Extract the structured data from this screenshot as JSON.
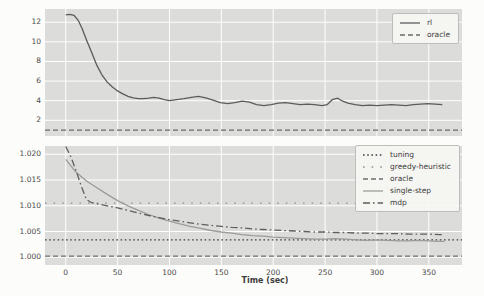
{
  "figure": {
    "xlabel": "Time (sec)",
    "background": "#fcfcfa",
    "plot_background": "#dcdcda",
    "grid_color": "#ffffff",
    "text_color": "#4a4a4a",
    "legend_border": "#bdbdbb"
  },
  "chart_data": [
    {
      "type": "line",
      "title": "",
      "xlabel": "",
      "ylabel": "",
      "xlim": [
        -20,
        382
      ],
      "ylim": [
        0.4,
        13.35
      ],
      "xticks": [
        0,
        50,
        100,
        150,
        200,
        250,
        300,
        350
      ],
      "show_xtick_labels": false,
      "yticks": [
        2,
        4,
        6,
        8,
        10,
        12
      ],
      "ytick_labels": [
        "2",
        "4",
        "6",
        "8",
        "10",
        "12"
      ],
      "grid": true,
      "legend_position": "upper right",
      "series": [
        {
          "name": "rl",
          "style": "solid",
          "color": "#5b5b5b",
          "x": [
            0,
            4,
            8,
            12,
            16,
            20,
            25,
            30,
            35,
            40,
            45,
            50,
            55,
            60,
            65,
            70,
            75,
            80,
            85,
            90,
            95,
            100,
            107,
            114,
            121,
            128,
            135,
            142,
            149,
            156,
            163,
            170,
            177,
            184,
            191,
            198,
            205,
            212,
            219,
            226,
            233,
            240,
            247,
            252,
            257,
            262,
            267,
            272,
            279,
            286,
            293,
            300,
            307,
            314,
            321,
            328,
            335,
            342,
            349,
            356,
            363
          ],
          "y": [
            12.75,
            12.8,
            12.7,
            12.2,
            11.3,
            10.2,
            8.9,
            7.6,
            6.6,
            5.9,
            5.4,
            5.0,
            4.7,
            4.45,
            4.3,
            4.2,
            4.2,
            4.25,
            4.35,
            4.25,
            4.1,
            4.0,
            4.1,
            4.2,
            4.35,
            4.45,
            4.3,
            4.05,
            3.8,
            3.7,
            3.8,
            3.95,
            3.85,
            3.6,
            3.5,
            3.6,
            3.75,
            3.8,
            3.7,
            3.6,
            3.65,
            3.6,
            3.5,
            3.6,
            4.1,
            4.25,
            3.95,
            3.75,
            3.6,
            3.5,
            3.55,
            3.5,
            3.55,
            3.6,
            3.55,
            3.5,
            3.6,
            3.65,
            3.7,
            3.65,
            3.6
          ]
        },
        {
          "name": "oracle",
          "style": "dashed",
          "color": "#696969",
          "x": [
            -20,
            382
          ],
          "y": [
            1.0,
            1.0
          ]
        }
      ]
    },
    {
      "type": "line",
      "title": "",
      "xlabel": "Time (sec)",
      "ylabel": "",
      "xlim": [
        -20,
        382
      ],
      "ylim": [
        0.9985,
        1.0216
      ],
      "xticks": [
        0,
        50,
        100,
        150,
        200,
        250,
        300,
        350
      ],
      "show_xtick_labels": true,
      "xtick_labels": [
        "0",
        "50",
        "100",
        "150",
        "200",
        "250",
        "300",
        "350"
      ],
      "yticks": [
        1.0,
        1.005,
        1.01,
        1.015,
        1.02
      ],
      "ytick_labels": [
        "1.000",
        "1.005",
        "1.010",
        "1.015",
        "1.020"
      ],
      "grid": true,
      "legend_position": "upper right",
      "series": [
        {
          "name": "tuning",
          "style": "dotted",
          "color": "#3f3f3f",
          "x": [
            -20,
            382
          ],
          "y": [
            1.0034,
            1.0034
          ]
        },
        {
          "name": "greedy-heuristic",
          "style": "sparse-dotted",
          "color": "#8f8f8f",
          "x": [
            -20,
            382
          ],
          "y": [
            1.0105,
            1.0105
          ]
        },
        {
          "name": "oracle",
          "style": "dashed",
          "color": "#6f6f6f",
          "x": [
            -20,
            382
          ],
          "y": [
            1.0002,
            1.0002
          ]
        },
        {
          "name": "single-step",
          "style": "solid",
          "color": "#9b9b99",
          "x": [
            0,
            10,
            20,
            30,
            40,
            50,
            60,
            70,
            80,
            90,
            100,
            110,
            120,
            130,
            140,
            150,
            160,
            170,
            180,
            190,
            200,
            210,
            220,
            230,
            240,
            250,
            260,
            270,
            280,
            290,
            300,
            310,
            320,
            330,
            340,
            350,
            360,
            365
          ],
          "y": [
            1.019,
            1.0165,
            1.0148,
            1.0135,
            1.0122,
            1.011,
            1.01,
            1.0091,
            1.0083,
            1.0076,
            1.007,
            1.0065,
            1.006,
            1.0056,
            1.0052,
            1.0049,
            1.0047,
            1.0044,
            1.0042,
            1.0041,
            1.0039,
            1.0038,
            1.0037,
            1.0036,
            1.0035,
            1.0035,
            1.0036,
            1.0035,
            1.0034,
            1.0033,
            1.0034,
            1.0033,
            1.0032,
            1.0032,
            1.0033,
            1.0032,
            1.0031,
            1.0031
          ]
        },
        {
          "name": "mdp",
          "style": "dashdot",
          "color": "#5e5e5e",
          "x": [
            0,
            5,
            10,
            15,
            20,
            25,
            30,
            40,
            50,
            60,
            70,
            80,
            90,
            100,
            110,
            120,
            130,
            140,
            150,
            160,
            170,
            180,
            190,
            200,
            210,
            220,
            230,
            240,
            250,
            260,
            270,
            280,
            290,
            300,
            310,
            320,
            330,
            340,
            350,
            360,
            365
          ],
          "y": [
            1.0215,
            1.0195,
            1.0168,
            1.0138,
            1.0112,
            1.0106,
            1.0104,
            1.01,
            1.0096,
            1.0091,
            1.0086,
            1.0081,
            1.0077,
            1.0073,
            1.007,
            1.0067,
            1.0064,
            1.0062,
            1.006,
            1.0058,
            1.0057,
            1.0055,
            1.0054,
            1.0053,
            1.0052,
            1.0051,
            1.005,
            1.0049,
            1.0049,
            1.0048,
            1.0048,
            1.0047,
            1.0047,
            1.0046,
            1.0046,
            1.0046,
            1.0045,
            1.0045,
            1.0045,
            1.0044,
            1.0044
          ]
        }
      ]
    }
  ]
}
